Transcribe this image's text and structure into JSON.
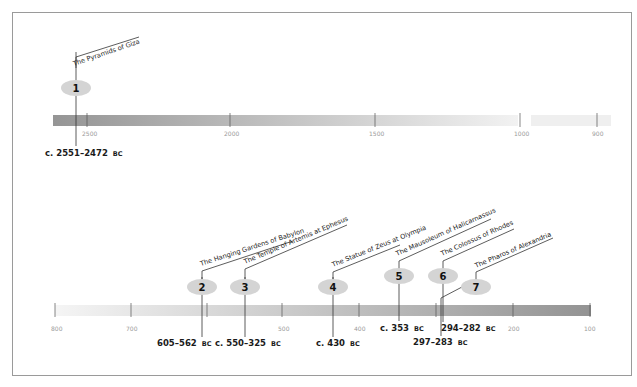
{
  "colors": {
    "frame_border": "#9a9a9a",
    "bar_dark": "#959595",
    "bar_light": "#f0f0f0",
    "marker_fill": "#d4d4d4",
    "line": "#333333",
    "tick_label": "#9a9a9a"
  },
  "top_timeline": {
    "ticks": [
      {
        "label": "2500",
        "x": 87
      },
      {
        "label": "2000",
        "x": 230
      },
      {
        "label": "1500",
        "x": 375
      },
      {
        "label": "1000",
        "x": 520
      },
      {
        "label": "900",
        "x": 597
      }
    ],
    "wonders": [
      {
        "number": "1",
        "name": "The Pyramids of Giza",
        "date": "c. 2551–2472",
        "era": "BC"
      }
    ]
  },
  "bottom_timeline": {
    "ticks": [
      {
        "label": "800",
        "x": 55
      },
      {
        "label": "700",
        "x": 131
      },
      {
        "label": "500",
        "x": 282
      },
      {
        "label": "400",
        "x": 359
      },
      {
        "label": "200",
        "x": 513
      },
      {
        "label": "100",
        "x": 590
      }
    ],
    "wonders": [
      {
        "number": "2",
        "name": "The Hanging Gardens of Babylon",
        "date": "605–562",
        "era": "BC"
      },
      {
        "number": "3",
        "name": "The Temple of Artemis at Ephesus",
        "date": "c. 550–325",
        "era": "BC"
      },
      {
        "number": "4",
        "name": "The Statue of Zeus at Olympia",
        "date": "c. 430",
        "era": "BC"
      },
      {
        "number": "5",
        "name": "The Mausoleum of Halicarnassus",
        "date": "c. 353",
        "era": "BC"
      },
      {
        "number": "6",
        "name": "The Colossus of Rhodes",
        "date": "294–282",
        "era": "BC"
      },
      {
        "number": "7",
        "name": "The Pharos of Alexandria",
        "date": "297–283",
        "era": "BC"
      }
    ]
  }
}
